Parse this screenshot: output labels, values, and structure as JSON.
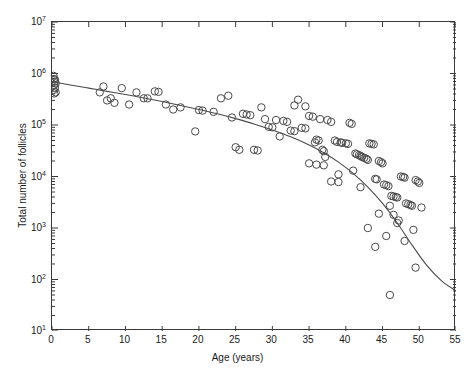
{
  "chart_data": {
    "type": "scatter",
    "title": "",
    "xlabel": "Age (years)",
    "ylabel": "Total number of follicles",
    "xlim": [
      0,
      55
    ],
    "ylim": [
      10,
      10000000
    ],
    "yscale": "log",
    "xscale": "linear",
    "grid": false,
    "legend": null,
    "xticks": [
      0,
      5,
      10,
      15,
      20,
      25,
      30,
      35,
      40,
      45,
      50,
      55
    ],
    "xtick_labels": [
      "0",
      "5",
      "10",
      "15",
      "20",
      "25",
      "30",
      "35",
      "40",
      "45",
      "50",
      "55"
    ],
    "yticks": [
      10,
      100,
      1000,
      10000,
      100000,
      1000000,
      10000000
    ],
    "ytick_labels": [
      "10^1",
      "10^2",
      "10^3",
      "10^4",
      "10^5",
      "10^6",
      "10^7"
    ],
    "ytick_mantissa": [
      "10",
      "10",
      "10",
      "10",
      "10",
      "10",
      "10"
    ],
    "ytick_exponent": [
      "1",
      "2",
      "3",
      "4",
      "5",
      "6",
      "7"
    ],
    "marker": "open-circle",
    "marker_size": 5,
    "marker_color": "#4a4a4a",
    "line_color": "#4a4a4a",
    "series": [
      {
        "name": "Follicle counts",
        "points": [
          [
            0.2,
            900000
          ],
          [
            0.3,
            780000
          ],
          [
            0.4,
            700000
          ],
          [
            0.5,
            640000
          ],
          [
            0.3,
            600000
          ],
          [
            0.4,
            520000
          ],
          [
            0.2,
            480000
          ],
          [
            0.5,
            430000
          ],
          [
            0.3,
            410000
          ],
          [
            0.4,
            760000
          ],
          [
            7.0,
            560000
          ],
          [
            7.5,
            300000
          ],
          [
            8.0,
            330000
          ],
          [
            8.5,
            270000
          ],
          [
            9.5,
            520000
          ],
          [
            10.5,
            250000
          ],
          [
            12.5,
            330000
          ],
          [
            13.0,
            330000
          ],
          [
            14.0,
            450000
          ],
          [
            14.5,
            440000
          ],
          [
            15.5,
            250000
          ],
          [
            16.5,
            200000
          ],
          [
            17.5,
            220000
          ],
          [
            19.5,
            75000
          ],
          [
            20.0,
            195000
          ],
          [
            20.5,
            190000
          ],
          [
            22.0,
            180000
          ],
          [
            23.0,
            330000
          ],
          [
            24.0,
            370000
          ],
          [
            24.5,
            140000
          ],
          [
            25.0,
            37000
          ],
          [
            25.5,
            33000
          ],
          [
            26.0,
            165000
          ],
          [
            26.5,
            160000
          ],
          [
            27.0,
            155000
          ],
          [
            28.5,
            220000
          ],
          [
            29.0,
            130000
          ],
          [
            30.5,
            125000
          ],
          [
            31.0,
            60000
          ],
          [
            31.5,
            120000
          ],
          [
            32.0,
            115000
          ],
          [
            32.5,
            78000
          ],
          [
            33.0,
            76000
          ],
          [
            33.5,
            310000
          ],
          [
            34.0,
            88000
          ],
          [
            34.5,
            86000
          ],
          [
            35.0,
            150000
          ],
          [
            35.5,
            145000
          ],
          [
            35.8,
            46000
          ],
          [
            36.0,
            52000
          ],
          [
            36.3,
            50000
          ],
          [
            36.5,
            130000
          ],
          [
            36.8,
            33000
          ],
          [
            37.0,
            31000
          ],
          [
            37.2,
            24000
          ],
          [
            37.5,
            125000
          ],
          [
            38.0,
            115000
          ],
          [
            38.5,
            50000
          ],
          [
            38.8,
            47000
          ],
          [
            39.0,
            11000
          ],
          [
            39.3,
            46000
          ],
          [
            39.5,
            45000
          ],
          [
            40.0,
            44000
          ],
          [
            40.3,
            43000
          ],
          [
            40.5,
            110000
          ],
          [
            40.8,
            105000
          ],
          [
            41.0,
            13000
          ],
          [
            41.3,
            28000
          ],
          [
            41.5,
            27000
          ],
          [
            41.8,
            26000
          ],
          [
            42.0,
            25000
          ],
          [
            42.2,
            24000
          ],
          [
            42.5,
            23000
          ],
          [
            42.8,
            22000
          ],
          [
            43.0,
            21000
          ],
          [
            43.2,
            44000
          ],
          [
            43.5,
            43000
          ],
          [
            43.8,
            42000
          ],
          [
            44.0,
            9000
          ],
          [
            44.2,
            8800
          ],
          [
            44.5,
            20000
          ],
          [
            44.8,
            19000
          ],
          [
            45.0,
            18000
          ],
          [
            45.2,
            7000
          ],
          [
            45.5,
            6800
          ],
          [
            45.8,
            6500
          ],
          [
            46.0,
            2700
          ],
          [
            46.2,
            4200
          ],
          [
            46.5,
            4100
          ],
          [
            46.8,
            4000
          ],
          [
            47.0,
            3900
          ],
          [
            47.2,
            1400
          ],
          [
            47.5,
            10000
          ],
          [
            47.8,
            9800
          ],
          [
            48.0,
            9500
          ],
          [
            48.2,
            3000
          ],
          [
            48.5,
            2900
          ],
          [
            48.8,
            2800
          ],
          [
            49.0,
            2700
          ],
          [
            49.2,
            920
          ],
          [
            49.5,
            8500
          ],
          [
            49.8,
            8000
          ],
          [
            50.0,
            7500
          ],
          [
            50.3,
            2500
          ],
          [
            43.0,
            1000
          ],
          [
            44.0,
            430
          ],
          [
            45.5,
            700
          ],
          [
            46.0,
            50
          ],
          [
            48.0,
            560
          ],
          [
            49.5,
            170
          ],
          [
            38.0,
            8000
          ],
          [
            39.0,
            7800
          ],
          [
            42.0,
            6200
          ],
          [
            44.5,
            1900
          ],
          [
            46.5,
            1800
          ],
          [
            47.0,
            1250
          ],
          [
            35.0,
            18000
          ],
          [
            36.0,
            17000
          ],
          [
            37.0,
            16500
          ],
          [
            33.0,
            240000
          ],
          [
            34.5,
            230000
          ],
          [
            29.5,
            92000
          ],
          [
            30.0,
            90000
          ],
          [
            27.5,
            33000
          ],
          [
            28.0,
            32000
          ],
          [
            11.5,
            430000
          ],
          [
            6.5,
            430000
          ]
        ]
      }
    ],
    "fit_curve": {
      "name": "fitted decline curve",
      "points": [
        [
          0.0,
          700000
        ],
        [
          2.5,
          600000
        ],
        [
          5.0,
          520000
        ],
        [
          7.5,
          450000
        ],
        [
          10.0,
          390000
        ],
        [
          12.5,
          335000
        ],
        [
          15.0,
          285000
        ],
        [
          17.5,
          240000
        ],
        [
          20.0,
          200000
        ],
        [
          22.5,
          165000
        ],
        [
          25.0,
          133000
        ],
        [
          27.5,
          105000
        ],
        [
          30.0,
          80000
        ],
        [
          32.5,
          59000
        ],
        [
          35.0,
          41000
        ],
        [
          37.0,
          29000
        ],
        [
          39.0,
          19000
        ],
        [
          41.0,
          11500
        ],
        [
          43.0,
          6200
        ],
        [
          45.0,
          3000
        ],
        [
          47.0,
          1250
        ],
        [
          49.0,
          470
        ],
        [
          51.0,
          190
        ],
        [
          53.0,
          95
        ],
        [
          55.0,
          60
        ]
      ]
    }
  },
  "axes": {
    "x_title": "Age (years)",
    "y_title": "Total number of follicles"
  }
}
